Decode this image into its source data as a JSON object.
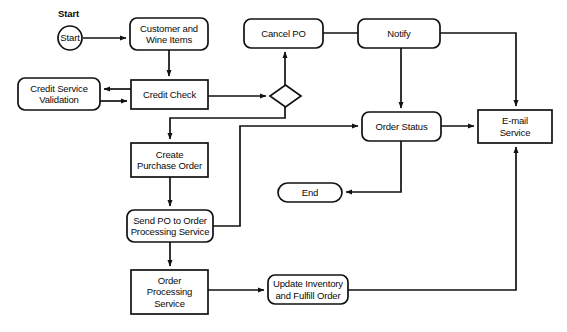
{
  "diagram": {
    "canvas": {
      "width": 567,
      "height": 332
    },
    "colors": {
      "background": "#ffffff",
      "stroke": "#111111",
      "text": "#0a0a0a",
      "fill": "#ffffff"
    },
    "labels": {
      "start": "Start"
    },
    "nodes": [
      {
        "id": "start",
        "label": "Start",
        "shape": "circle",
        "x": 58,
        "y": 26,
        "w": 24,
        "h": 24
      },
      {
        "id": "customer-and-wine-items",
        "label": "Customer and\nWine Items",
        "shape": "rounded-rect",
        "x": 130,
        "y": 18,
        "w": 78,
        "h": 32
      },
      {
        "id": "credit-service-validation",
        "label": "Credit Service\nValidation",
        "shape": "rounded-rect",
        "x": 18,
        "y": 78,
        "w": 82,
        "h": 32
      },
      {
        "id": "credit-check",
        "label": "Credit Check",
        "shape": "rect",
        "x": 131,
        "y": 80,
        "w": 77,
        "h": 29
      },
      {
        "id": "decision",
        "label": "",
        "shape": "diamond",
        "x": 270,
        "y": 85,
        "w": 31,
        "h": 22
      },
      {
        "id": "cancel-po",
        "label": "Cancel PO",
        "shape": "rounded-rect",
        "x": 244,
        "y": 19,
        "w": 79,
        "h": 29
      },
      {
        "id": "notify",
        "label": "Notify",
        "shape": "rounded-rect",
        "x": 358,
        "y": 19,
        "w": 82,
        "h": 29
      },
      {
        "id": "order-status",
        "label": "Order Status",
        "shape": "rounded-rect",
        "x": 362,
        "y": 112,
        "w": 79,
        "h": 29
      },
      {
        "id": "email-service",
        "label": "E-mail\nService",
        "shape": "rect",
        "x": 478,
        "y": 110,
        "w": 74,
        "h": 33
      },
      {
        "id": "create-purchase-order",
        "label": "Create\nPurchase Order",
        "shape": "rect",
        "x": 131,
        "y": 143,
        "w": 77,
        "h": 34
      },
      {
        "id": "send-po-to-order-processing-service",
        "label": "Send PO to Order\nProcessing Service",
        "shape": "rounded-rect",
        "x": 127,
        "y": 210,
        "w": 86,
        "h": 32
      },
      {
        "id": "end",
        "label": "End",
        "shape": "stadium",
        "x": 278,
        "y": 183,
        "w": 64,
        "h": 19
      },
      {
        "id": "order-processing-service",
        "label": "Order\nProcessing\nService",
        "shape": "rect",
        "x": 131,
        "y": 270,
        "w": 77,
        "h": 44
      },
      {
        "id": "update-inventory-and-fulfill-order",
        "label": "Update Inventory\nand Fulfill Order",
        "shape": "rounded-rect",
        "x": 268,
        "y": 275,
        "w": 80,
        "h": 29
      }
    ],
    "edges": [
      {
        "id": "start-to-customer",
        "from": "start",
        "to": "customer-and-wine-items",
        "path": "M 83 38 L 126 38",
        "arrow": true
      },
      {
        "id": "customer-to-credit-check",
        "from": "customer-and-wine-items",
        "to": "credit-check",
        "path": "M 169 50 L 169 76",
        "arrow": true
      },
      {
        "id": "credit-check-to-validation",
        "from": "credit-check",
        "to": "credit-service-validation",
        "path": "M 131 89 L 104 89",
        "arrow": true
      },
      {
        "id": "validation-to-credit-check",
        "from": "credit-service-validation",
        "to": "credit-check",
        "path": "M 100 101 L 127 101",
        "arrow": true
      },
      {
        "id": "credit-check-to-decision",
        "from": "credit-check",
        "to": "decision",
        "path": "M 208 96 L 266 96",
        "arrow": true
      },
      {
        "id": "decision-to-cancel-po",
        "from": "decision",
        "to": "cancel-po",
        "path": "M 285 85 L 285 52",
        "arrow": true
      },
      {
        "id": "decision-to-create-purchase-order",
        "from": "decision",
        "to": "create-purchase-order",
        "path": "M 285 107 L 285 118 L 170 118 L 170 139",
        "arrow": true
      },
      {
        "id": "cancel-po-to-notify",
        "from": "cancel-po",
        "to": "notify",
        "path": "M 323 33 L 358 33",
        "arrow": false
      },
      {
        "id": "notify-to-order-status",
        "from": "notify",
        "to": "order-status",
        "path": "M 401 48 L 401 108",
        "arrow": true
      },
      {
        "id": "notify-to-email-service",
        "from": "notify",
        "to": "email-service",
        "path": "M 440 33 L 516 33 L 516 106",
        "arrow": true
      },
      {
        "id": "order-status-to-email-service",
        "from": "order-status",
        "to": "email-service",
        "path": "M 441 126 L 474 126",
        "arrow": true
      },
      {
        "id": "order-status-to-end",
        "from": "order-status",
        "to": "end",
        "path": "M 401 141 L 401 192 L 346 192",
        "arrow": true
      },
      {
        "id": "create-purchase-order-to-send-po",
        "from": "create-purchase-order",
        "to": "send-po-to-order-processing-service",
        "path": "M 170 177 L 170 206",
        "arrow": true
      },
      {
        "id": "send-po-to-order-status",
        "from": "send-po-to-order-processing-service",
        "to": "order-status",
        "path": "M 213 226 L 240 226 L 240 126 L 358 126",
        "arrow": true
      },
      {
        "id": "send-po-to-order-processing",
        "from": "send-po-to-order-processing-service",
        "to": "order-processing-service",
        "path": "M 170 242 L 170 266",
        "arrow": true
      },
      {
        "id": "order-processing-to-update-inventory",
        "from": "order-processing-service",
        "to": "update-inventory-and-fulfill-order",
        "path": "M 208 290 L 264 290",
        "arrow": true
      },
      {
        "id": "update-inventory-to-email-service",
        "from": "update-inventory-and-fulfill-order",
        "to": "email-service",
        "path": "M 348 290 L 516 290 L 516 147",
        "arrow": true
      }
    ]
  }
}
